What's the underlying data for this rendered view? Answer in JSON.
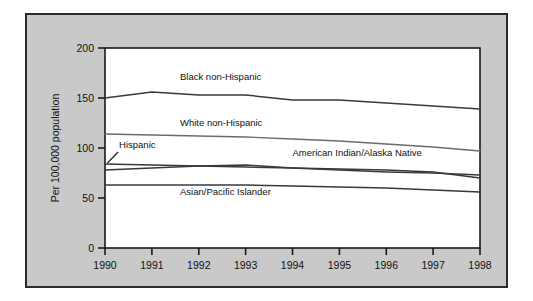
{
  "figure": {
    "background_color": "#ffffff",
    "panel_color": "#c9c9c9",
    "panel_border_color": "#2b2b2b",
    "plot_background_color": "#ffffff",
    "axis_color": "#1a1a1a"
  },
  "chart_data": {
    "type": "line",
    "title": "",
    "subtitle": "",
    "xlabel": "",
    "ylabel": "Per 100,000 population",
    "x": [
      1990,
      1991,
      1992,
      1993,
      1994,
      1995,
      1996,
      1997,
      1998
    ],
    "categories": [
      "1990",
      "1991",
      "1992",
      "1993",
      "1994",
      "1995",
      "1996",
      "1997",
      "1998"
    ],
    "xlim": [
      1990,
      1998
    ],
    "ylim": [
      0,
      200
    ],
    "yticks": [
      0,
      50,
      100,
      150,
      200
    ],
    "ytick_labels": [
      "0",
      "50",
      "100",
      "150",
      "200"
    ],
    "xticks": [
      1990,
      1991,
      1992,
      1993,
      1994,
      1995,
      1996,
      1997,
      1998
    ],
    "xtick_labels": [
      "1990",
      "1991",
      "1992",
      "1993",
      "1994",
      "1995",
      "1996",
      "1997",
      "1998"
    ],
    "grid": false,
    "legend_position": "inline-labels",
    "series": [
      {
        "name": "Black non-Hispanic",
        "color": "#3a3a3a",
        "values": [
          150,
          156,
          153,
          153,
          148,
          148,
          145,
          142,
          139
        ],
        "label_x": 1991.6,
        "label_y": 168
      },
      {
        "name": "White non-Hispanic",
        "color": "#6b6b6b",
        "values": [
          114,
          113,
          112,
          111,
          109,
          107,
          104,
          101,
          97
        ],
        "label_x": 1991.6,
        "label_y": 122
      },
      {
        "name": "Hispanic",
        "color": "#3a3a3a",
        "values": [
          84,
          83,
          82,
          81,
          80,
          79,
          78,
          76,
          70
        ],
        "label_x": 1990.3,
        "label_y": 100,
        "leader_from_x": 1990.28,
        "leader_from_y": 96,
        "leader_to_x": 1990.05,
        "leader_to_y": 85
      },
      {
        "name": "American Indian/Alaska Native",
        "color": "#3a3a3a",
        "values": [
          78,
          80,
          82,
          83,
          80,
          78,
          76,
          75,
          73
        ],
        "label_x": 1994.0,
        "label_y": 92
      },
      {
        "name": "Asian/Pacific Islander",
        "color": "#3a3a3a",
        "values": [
          63,
          63,
          63,
          63,
          62,
          61,
          60,
          58,
          56
        ],
        "label_x": 1991.6,
        "label_y": 53
      }
    ]
  }
}
